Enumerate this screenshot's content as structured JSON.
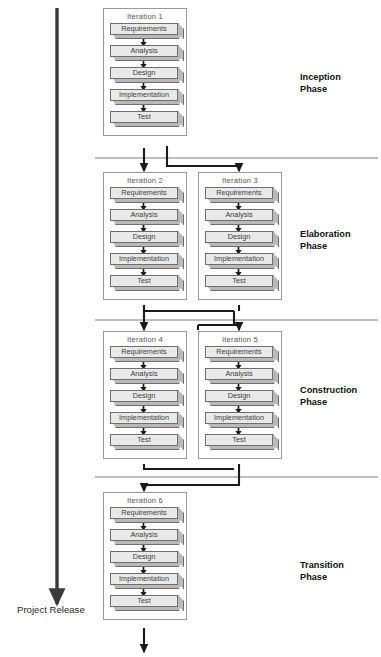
{
  "diagram": {
    "activity_labels": [
      "Requirements",
      "Analysis",
      "Design",
      "Implementation",
      "Test"
    ],
    "timeline_label": "Project Release",
    "colors": {
      "box_fill": "#e9e9e9",
      "box_fold": "#b9b9b9",
      "box_border": "#6e6e6e",
      "container_border": "#9a9a9a",
      "connector": "#1a1a1a",
      "divider": "#6e6e6e",
      "timeline_arrow": "#3a3a3a",
      "text": "#3d3d3d"
    },
    "phases": [
      {
        "name": "Inception\nPhase",
        "label_x": 300,
        "label_y": 72,
        "divider_y": 158,
        "iterations": [
          {
            "title": "Iteration 1",
            "x": 103,
            "y": 8,
            "col": "left"
          }
        ]
      },
      {
        "name": "Elaboration\nPhase",
        "label_x": 300,
        "label_y": 229,
        "divider_y": 320,
        "iterations": [
          {
            "title": "Iteration 2",
            "x": 103,
            "y": 172,
            "col": "left"
          },
          {
            "title": "Iteration 3",
            "x": 198,
            "y": 172,
            "col": "right"
          }
        ]
      },
      {
        "name": "Construction\nPhase",
        "label_x": 300,
        "label_y": 385,
        "divider_y": 477,
        "iterations": [
          {
            "title": "Iteration 4",
            "x": 103,
            "y": 331,
            "col": "left"
          },
          {
            "title": "Iteration 5",
            "x": 198,
            "y": 331,
            "col": "right"
          }
        ]
      },
      {
        "name": "Transition\nPhase",
        "label_x": 300,
        "label_y": 560,
        "divider_y": null,
        "iterations": [
          {
            "title": "Iteration 6",
            "x": 103,
            "y": 492,
            "col": "left"
          }
        ]
      }
    ]
  },
  "chart_data": {
    "type": "diagram",
    "phases": [
      "Inception Phase",
      "Elaboration Phase",
      "Construction Phase",
      "Transition Phase"
    ],
    "iterations_per_phase": [
      1,
      2,
      2,
      1
    ],
    "iteration_names": [
      "Iteration 1",
      "Iteration 2",
      "Iteration 3",
      "Iteration 4",
      "Iteration 5",
      "Iteration 6"
    ],
    "workflow_activities": [
      "Requirements",
      "Analysis",
      "Design",
      "Implementation",
      "Test"
    ],
    "timeline": {
      "direction": "top-to-bottom",
      "end_label": "Project Release"
    }
  }
}
